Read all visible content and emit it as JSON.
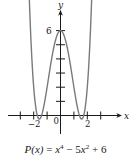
{
  "chart_data": {
    "type": "line",
    "title": "",
    "function": "P(x) = x^4 - 5x^2 + 6",
    "xlabel": "x",
    "ylabel": "y",
    "xlim": [
      -3.1,
      3.4
    ],
    "ylim": [
      -1.5,
      6.6
    ],
    "x_ticks": [
      -3,
      -2,
      -1,
      0,
      1,
      2,
      3
    ],
    "x_tick_labels": [
      {
        "value": -2,
        "text": "−2"
      },
      {
        "value": 0,
        "text": "0"
      },
      {
        "value": 2,
        "text": "2"
      }
    ],
    "y_ticks": [
      1,
      2,
      3,
      4,
      5,
      6
    ],
    "y_tick_labels": [
      {
        "value": 6,
        "text": "6"
      }
    ],
    "grid": false,
    "legend": null,
    "series": [
      {
        "name": "P(x)",
        "x": [
          -2.45,
          -2.2,
          -2.0,
          -1.8,
          -1.58,
          -1.4,
          -1.2,
          -1.0,
          -0.8,
          -0.6,
          -0.4,
          -0.2,
          0,
          0.2,
          0.4,
          0.6,
          0.8,
          1.0,
          1.2,
          1.4,
          1.58,
          1.8,
          2.0,
          2.2,
          2.45
        ],
        "values": [
          6.02,
          4.03,
          2.0,
          0.3,
          -0.25,
          0.04,
          0.87,
          2.0,
          3.21,
          4.33,
          5.23,
          5.8,
          6.0,
          5.8,
          5.23,
          4.33,
          3.21,
          2.0,
          0.87,
          0.04,
          -0.25,
          0.3,
          2.0,
          4.03,
          6.02
        ]
      }
    ],
    "key_points": {
      "y_intercept": [
        0,
        6
      ],
      "local_minima": [
        [
          -1.58,
          -0.25
        ],
        [
          1.58,
          -0.25
        ]
      ],
      "x_intercepts": [
        -1.732,
        -1.414,
        1.414,
        1.732
      ]
    }
  },
  "labels": {
    "x_axis": "x",
    "y_axis": "y",
    "y6": "6",
    "xneg2": "−2",
    "x0": "0",
    "x2": "2"
  },
  "caption": {
    "lhs": "P(x)",
    "eq": " = ",
    "t1": "x",
    "t1_exp": "4",
    "op1": " − 5",
    "t2": "x",
    "t2_exp": "2",
    "op2": " + 6"
  }
}
